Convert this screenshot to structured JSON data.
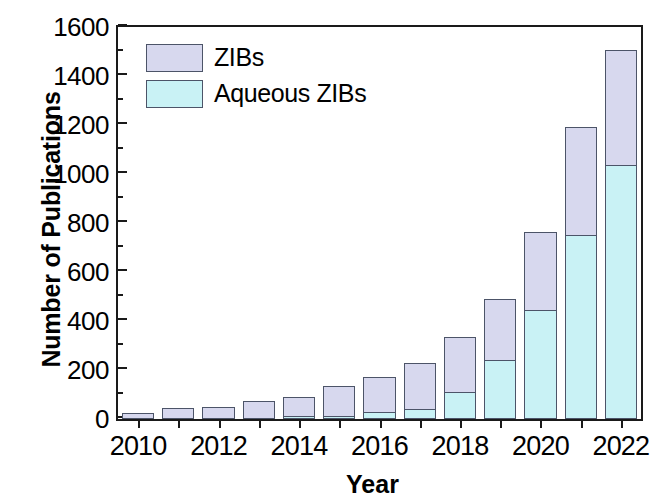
{
  "chart_data": {
    "type": "bar",
    "stacked": true,
    "title": "",
    "xlabel": "Year",
    "ylabel": "Number of Publications",
    "categories": [
      "2010",
      "2011",
      "2012",
      "2013",
      "2014",
      "2015",
      "2016",
      "2017",
      "2018",
      "2019",
      "2020",
      "2021",
      "2022"
    ],
    "x_tick_labels": [
      "2010",
      "2012",
      "2014",
      "2016",
      "2018",
      "2020",
      "2022"
    ],
    "y_tick_labels": [
      "0",
      "200",
      "400",
      "600",
      "800",
      "1000",
      "1200",
      "1400",
      "1600"
    ],
    "ylim": [
      0,
      1600
    ],
    "y_major_step": 200,
    "y_minor_step": 100,
    "grid": false,
    "legend_position": "top-left",
    "series": [
      {
        "name": "ZIBs",
        "color": "#d7d8ee",
        "note": "total publications (outer stack, drawn full height)",
        "values": [
          25,
          45,
          50,
          75,
          90,
          135,
          172,
          230,
          335,
          490,
          765,
          1190,
          1505
        ]
      },
      {
        "name": "Aqueous ZIBs",
        "color": "#c9f2f5",
        "note": "subset of total (inner stack, drawn from baseline)",
        "values": [
          0,
          0,
          0,
          0,
          2,
          12,
          28,
          42,
          110,
          240,
          445,
          750,
          1035
        ]
      }
    ]
  },
  "legend": {
    "items": [
      {
        "label": "ZIBs",
        "color": "#d7d8ee"
      },
      {
        "label": "Aqueous ZIBs",
        "color": "#c9f2f5"
      }
    ]
  },
  "axes": {
    "y_title": "Number of Publications",
    "x_title": "Year"
  },
  "colors": {
    "zibs": "#d7d8ee",
    "aqueous_zibs": "#c9f2f5",
    "outline": "#4c5468",
    "axis": "#1a1a1a",
    "background": "#ffffff"
  }
}
